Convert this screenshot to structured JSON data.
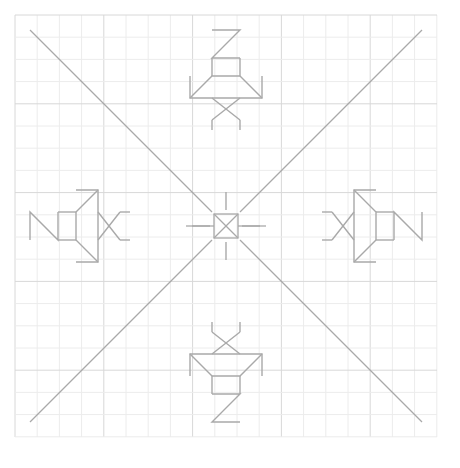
{
  "figure": {
    "canvas": {
      "width": 460,
      "height": 468,
      "background": "#ffffff"
    },
    "grid": {
      "x0": 15,
      "y0": 15,
      "x1": 437,
      "y1": 437,
      "step": 22.2,
      "minor_color": "#ececec",
      "major_color": "#d8d8d8",
      "major_every": 4
    },
    "colors": {
      "green": "#bde08a",
      "yellow": "#faf0a0",
      "blue": "#cdeef3",
      "magenta": "#f9c4d4",
      "magenta_strong": "#f98ca8",
      "hatch_red": "#e8455f",
      "outline_black": "#1a1a1a",
      "outline_gray": "#a9a9a9",
      "cell_edge": "#b9b9b9",
      "dot_red": "#f0243c",
      "text": "#3a3a3a"
    }
  },
  "labels": [
    {
      "id": "green",
      "text": "グリーン",
      "x": 378,
      "y": 124,
      "leader": [
        [
          372,
          128
        ],
        [
          357,
          120
        ]
      ]
    },
    {
      "id": "magenta",
      "text": "マゼンダ",
      "x": 361,
      "y": 273,
      "leader": [
        [
          358,
          268
        ],
        [
          344,
          258
        ]
      ]
    },
    {
      "id": "yellow",
      "text": "イエロー",
      "x": 373,
      "y": 350,
      "leader": [
        [
          370,
          352
        ],
        [
          358,
          349
        ]
      ]
    },
    {
      "id": "blue",
      "text": "ブルー",
      "x": 168,
      "y": 370,
      "leader": [
        [
          190,
          366
        ],
        [
          217,
          330
        ]
      ]
    }
  ],
  "markers": [
    {
      "id": "A",
      "text": "A",
      "x": 349,
      "y": 148,
      "leader": [
        [
          351,
          142
        ],
        [
          346,
          128
        ]
      ]
    },
    {
      "id": "B",
      "text": "B",
      "x": 298,
      "y": 199
    },
    {
      "id": "A_R",
      "text": "A=R",
      "x": 325,
      "y": 199
    },
    {
      "id": "C",
      "text": "C",
      "x": 296,
      "y": 231
    }
  ],
  "motifs": {
    "corner_squares": [
      {
        "id": "yellow-top-left",
        "color": "yellow",
        "cx": 117,
        "cy": 115
      },
      {
        "id": "green-top-right",
        "color": "green",
        "cx": 345,
        "cy": 115
      },
      {
        "id": "green-bottom-left",
        "color": "green",
        "cx": 117,
        "cy": 343
      },
      {
        "id": "yellow-bottom-right",
        "color": "yellow",
        "cx": 345,
        "cy": 343
      }
    ],
    "crosses": [
      {
        "id": "blue-top",
        "color": "blue",
        "cx": 231,
        "cy": 143
      },
      {
        "id": "magenta-left",
        "color": "magenta",
        "cx": 152,
        "cy": 233
      },
      {
        "id": "magenta-right",
        "color": "magenta",
        "cx": 312,
        "cy": 233,
        "dots": true
      },
      {
        "id": "blue-bottom",
        "color": "blue",
        "cx": 231,
        "cy": 318
      }
    ]
  },
  "chart_data": {
    "type": "diagram",
    "title": "",
    "symmetry": "4-fold dihedral about centre (226,226)",
    "elements": {
      "colour_keyed_cells": 4,
      "plus_shaped_clusters": 4,
      "lattice_dots": 9
    }
  }
}
